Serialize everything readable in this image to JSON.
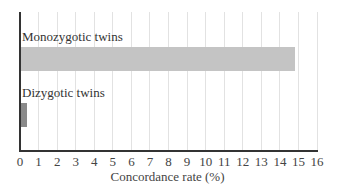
{
  "chart_data": {
    "type": "bar",
    "orientation": "horizontal",
    "title": "",
    "xlabel": "Concordance rate (%)",
    "ylabel": "",
    "xlim": [
      0,
      16
    ],
    "x_ticks": [
      0,
      1,
      2,
      3,
      4,
      5,
      6,
      7,
      8,
      9,
      10,
      11,
      12,
      13,
      14,
      15,
      16
    ],
    "grid": "vertical",
    "legend": null,
    "categories": [
      "Monozygotic twins",
      "Dizygotic twins"
    ],
    "values": [
      14.8,
      0.4
    ],
    "colors": [
      "#c4c4c4",
      "#8a8a8a"
    ]
  }
}
